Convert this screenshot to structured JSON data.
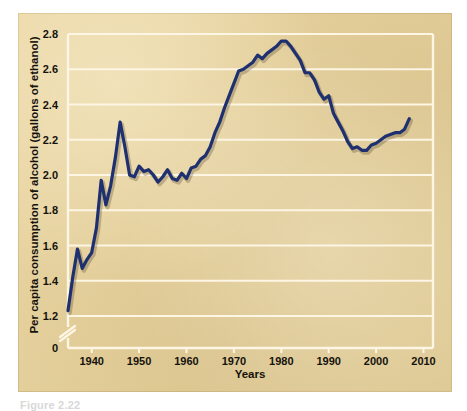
{
  "figure": {
    "caption": "Figure 2.22"
  },
  "chart_data": {
    "type": "line",
    "title": "",
    "xlabel": "Years",
    "ylabel": "Per capita consumption of alcohol (gallons of ethanol)",
    "xlim": [
      1935,
      2012
    ],
    "ylim": [
      1.2,
      2.8
    ],
    "y_axis_break": true,
    "y_axis_break_baseline": "0",
    "grid": true,
    "grid_axis": "y",
    "legend": "none",
    "line_color": "#1e3070",
    "background_color": "#e8d29a",
    "gridline_color": "#fdf6e4",
    "x_tick_labels": [
      "1940",
      "1950",
      "1960",
      "1970",
      "1980",
      "1990",
      "2000",
      "2010"
    ],
    "x_ticks": [
      1940,
      1950,
      1960,
      1970,
      1980,
      1990,
      2000,
      2010
    ],
    "y_tick_labels": [
      "0",
      "1.2",
      "1.4",
      "1.6",
      "1.8",
      "2.0",
      "2.2",
      "2.4",
      "2.6",
      "2.8"
    ],
    "y_ticks": [
      1.2,
      1.4,
      1.6,
      1.8,
      2.0,
      2.2,
      2.4,
      2.6,
      2.8
    ],
    "x": [
      1935,
      1936,
      1937,
      1938,
      1939,
      1940,
      1941,
      1942,
      1943,
      1944,
      1945,
      1946,
      1947,
      1948,
      1949,
      1950,
      1951,
      1952,
      1953,
      1954,
      1955,
      1956,
      1957,
      1958,
      1959,
      1960,
      1961,
      1962,
      1963,
      1964,
      1965,
      1966,
      1967,
      1968,
      1969,
      1970,
      1971,
      1972,
      1973,
      1974,
      1975,
      1976,
      1977,
      1978,
      1979,
      1980,
      1981,
      1982,
      1983,
      1984,
      1985,
      1986,
      1987,
      1988,
      1989,
      1990,
      1991,
      1992,
      1993,
      1994,
      1995,
      1996,
      1997,
      1998,
      1999,
      2000,
      2001,
      2002,
      2003,
      2004,
      2005,
      2006,
      2007
    ],
    "values": [
      1.23,
      1.42,
      1.58,
      1.47,
      1.52,
      1.56,
      1.7,
      1.97,
      1.83,
      1.94,
      2.1,
      2.3,
      2.16,
      2.0,
      1.99,
      2.05,
      2.02,
      2.03,
      2.0,
      1.96,
      1.99,
      2.03,
      1.98,
      1.97,
      2.01,
      1.98,
      2.04,
      2.05,
      2.09,
      2.11,
      2.16,
      2.24,
      2.3,
      2.38,
      2.45,
      2.52,
      2.59,
      2.6,
      2.62,
      2.64,
      2.68,
      2.66,
      2.69,
      2.71,
      2.73,
      2.76,
      2.76,
      2.73,
      2.69,
      2.65,
      2.58,
      2.58,
      2.54,
      2.47,
      2.43,
      2.45,
      2.35,
      2.3,
      2.25,
      2.19,
      2.15,
      2.16,
      2.14,
      2.14,
      2.17,
      2.18,
      2.2,
      2.22,
      2.23,
      2.24,
      2.24,
      2.26,
      2.32
    ],
    "series": [
      {
        "name": "Per capita consumption of alcohol",
        "units": "gallons of ethanol",
        "color": "#1e3070"
      }
    ],
    "annotations": [
      {
        "label": "1946 post-war peak",
        "x": 1946,
        "y": 2.3
      },
      {
        "label": "1980-81 maximum",
        "x": 1980,
        "y": 2.76
      },
      {
        "label": "1935 series start",
        "x": 1935,
        "y": 1.23
      },
      {
        "label": "late-1990s trough",
        "x": 1997,
        "y": 2.14
      },
      {
        "label": "2007 series end",
        "x": 2007,
        "y": 2.32
      }
    ]
  }
}
